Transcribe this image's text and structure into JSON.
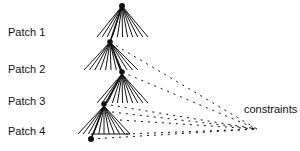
{
  "patches": [
    {
      "label": "Patch 1"
    },
    {
      "label": "Patch 2"
    },
    {
      "label": "Patch 3"
    },
    {
      "label": "Patch 4"
    }
  ],
  "constraints_label": "constraints",
  "colors": {
    "line": "#111111",
    "background": "#ffffff"
  }
}
